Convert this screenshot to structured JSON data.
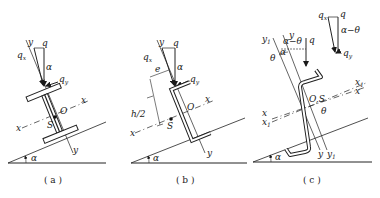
{
  "figure": {
    "panels": [
      {
        "id": "a",
        "caption": "( a )",
        "section": "I-beam",
        "labels": {
          "y_top": "y",
          "q": "q",
          "qx": "q",
          "qx_sub": "x",
          "alpha": "α",
          "qy": "q",
          "qy_sub": "y",
          "O": "O",
          "S": "S",
          "x_right": "x",
          "x_left": "x",
          "y_bottom": "y",
          "ground_alpha": "α"
        }
      },
      {
        "id": "b",
        "caption": "( b )",
        "section": "channel",
        "labels": {
          "y_top": "y",
          "q": "q",
          "qx": "q",
          "qx_sub": "x",
          "alpha": "α",
          "e": "e",
          "qy": "q",
          "qy_sub": "y",
          "O": "O",
          "x_right": "x",
          "h2": "h/2",
          "S": "S",
          "x_left": "x",
          "y_bottom": "y",
          "ground_alpha": "α"
        }
      },
      {
        "id": "c",
        "caption": "( c )",
        "section": "Z-section",
        "labels": {
          "y1_top": "y",
          "y1_top_sub": "1",
          "y_top": "y",
          "alpha_minus_theta": "α−θ",
          "q": "q",
          "alpha": "α",
          "theta": "θ",
          "inset_qx": "q",
          "inset_qx_sub": "x",
          "inset_q": "q",
          "inset_alpha_minus_theta": "α−θ",
          "inset_qy": "q",
          "inset_qy_sub": "y",
          "OS": "O,S",
          "x1_right": "x",
          "x1_right_sub": "1",
          "x_right": "x",
          "theta2": "θ",
          "x_left": "x",
          "x1_left": "x",
          "x1_left_sub": "1",
          "y_bottom": "y",
          "y1_bottom": "y",
          "y1_bottom_sub": "1",
          "ground_alpha": "α"
        }
      }
    ]
  }
}
